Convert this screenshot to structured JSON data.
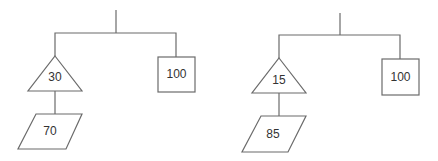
{
  "diagram": {
    "type": "tree",
    "trees": [
      {
        "root": {
          "children": [
            {
              "shape": "triangle",
              "value": "30",
              "children": [
                {
                  "shape": "parallelogram",
                  "value": "70"
                }
              ]
            },
            {
              "shape": "square",
              "value": "100"
            }
          ]
        }
      },
      {
        "root": {
          "children": [
            {
              "shape": "triangle",
              "value": "15",
              "children": [
                {
                  "shape": "parallelogram",
                  "value": "85"
                }
              ]
            },
            {
              "shape": "square",
              "value": "100"
            }
          ]
        }
      }
    ]
  },
  "colors": {
    "stroke": "#6b6b6b",
    "text": "#333333",
    "background": "#ffffff"
  }
}
